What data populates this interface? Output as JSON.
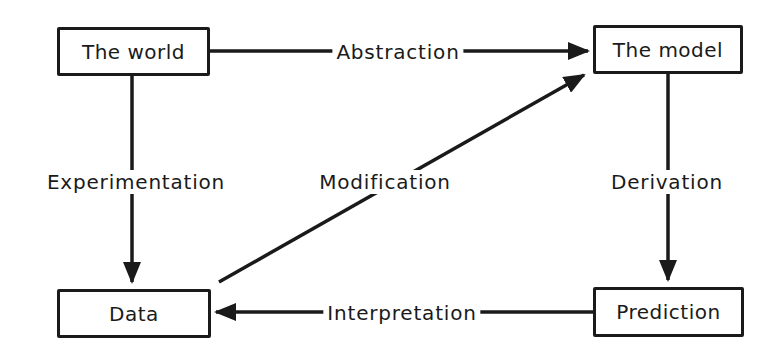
{
  "diagram": {
    "nodes": {
      "world": "The world",
      "model": "The model",
      "data": "Data",
      "prediction": "Prediction"
    },
    "edges": {
      "abstraction": "Abstraction",
      "experimentation": "Experimentation",
      "modification": "Modification",
      "derivation": "Derivation",
      "interpretation": "Interpretation"
    },
    "relations": [
      {
        "from": "The world",
        "to": "The model",
        "label": "Abstraction"
      },
      {
        "from": "The world",
        "to": "Data",
        "label": "Experimentation"
      },
      {
        "from": "Data",
        "to": "The model",
        "label": "Modification"
      },
      {
        "from": "The model",
        "to": "Prediction",
        "label": "Derivation"
      },
      {
        "from": "Prediction",
        "to": "Data",
        "label": "Interpretation"
      }
    ],
    "colors": {
      "ink": "#1a1a1a",
      "background": "#ffffff"
    }
  }
}
